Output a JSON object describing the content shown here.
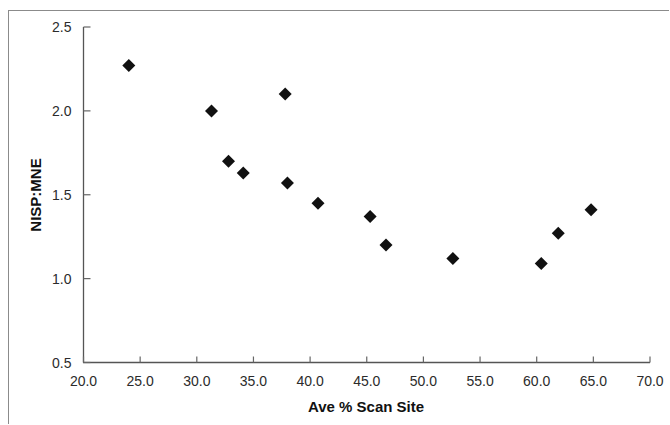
{
  "chart_data": {
    "type": "scatter",
    "title": "",
    "xlabel": "Ave % Scan Site",
    "ylabel": "NISP:MNE",
    "xlim": [
      20.0,
      70.0
    ],
    "ylim": [
      0.5,
      2.5
    ],
    "xticks": [
      "20.0",
      "25.0",
      "30.0",
      "35.0",
      "40.0",
      "45.0",
      "50.0",
      "55.0",
      "60.0",
      "65.0",
      "70.0"
    ],
    "yticks": [
      "0.5",
      "1.0",
      "1.5",
      "2.0",
      "2.5"
    ],
    "xtick_values": [
      20.0,
      25.0,
      30.0,
      35.0,
      40.0,
      45.0,
      50.0,
      55.0,
      60.0,
      65.0,
      70.0
    ],
    "ytick_values": [
      0.5,
      1.0,
      1.5,
      2.0,
      2.5
    ],
    "grid": false,
    "legend": null,
    "marker_shape": "diamond",
    "marker_color": "#111111",
    "marker_size": 13,
    "series": [
      {
        "name": "NISP:MNE vs Ave % Scan Site",
        "points": [
          {
            "x": 24.0,
            "y": 2.27
          },
          {
            "x": 31.3,
            "y": 2.0
          },
          {
            "x": 32.8,
            "y": 1.7
          },
          {
            "x": 34.1,
            "y": 1.63
          },
          {
            "x": 37.8,
            "y": 2.1
          },
          {
            "x": 38.0,
            "y": 1.57
          },
          {
            "x": 40.7,
            "y": 1.45
          },
          {
            "x": 45.3,
            "y": 1.37
          },
          {
            "x": 46.7,
            "y": 1.2
          },
          {
            "x": 52.6,
            "y": 1.12
          },
          {
            "x": 60.4,
            "y": 1.09
          },
          {
            "x": 61.9,
            "y": 1.27
          },
          {
            "x": 64.8,
            "y": 1.41
          }
        ]
      }
    ]
  },
  "axes": {
    "x_title": "Ave % Scan Site",
    "y_title": "NISP:MNE"
  }
}
